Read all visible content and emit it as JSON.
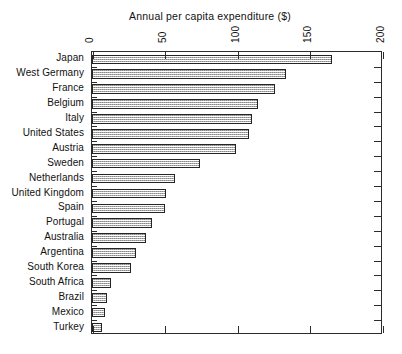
{
  "chart_data": {
    "type": "bar",
    "orientation": "horizontal",
    "title": "Annual per capita expenditure ($)",
    "xlabel": "",
    "ylabel": "",
    "xlim": [
      0,
      200
    ],
    "xticks": [
      "0",
      "50",
      "100",
      "150",
      "200"
    ],
    "xtick_values": [
      0,
      50,
      100,
      150,
      200
    ],
    "grid": false,
    "legend": null,
    "axis_position": "top",
    "tick_label_rotation": 90,
    "categories": [
      "Japan",
      "West Germany",
      "France",
      "Belgium",
      "Italy",
      "United States",
      "Austria",
      "Sweden",
      "Netherlands",
      "United Kingdom",
      "Spain",
      "Portugal",
      "Australia",
      "Argentina",
      "South Korea",
      "South Africa",
      "Brazil",
      "Mexico",
      "Turkey"
    ],
    "values": [
      165,
      133,
      126,
      114,
      110,
      108,
      99,
      74,
      57,
      51,
      50,
      41,
      37,
      30,
      27,
      13,
      10,
      9,
      7
    ]
  },
  "style": {
    "bar_fill": "#dcdcdc",
    "bar_border": "#242424",
    "axis_color": "#2b2b2b",
    "text_color": "#111111",
    "background": "#ffffff"
  }
}
